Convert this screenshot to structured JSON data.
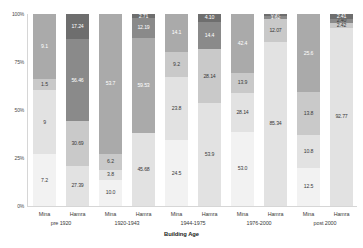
{
  "chart_data": {
    "type": "bar",
    "title": "",
    "xlabel": "Building Age",
    "ylabel": "",
    "ylim": [
      0,
      100
    ],
    "stacked": true,
    "percent": true,
    "grid": false,
    "legend": "none",
    "ytick_labels": [
      "0%",
      "25%",
      "50%",
      "75%",
      "100%"
    ],
    "ytick_values": [
      0,
      25,
      50,
      75,
      100
    ],
    "categories": [
      "pre 1920",
      "1920-1943",
      "1944-1975",
      "1976-2000",
      "post 2000"
    ],
    "subcategories": [
      "Mina",
      "Hamra"
    ],
    "series": [
      {
        "name": "s1",
        "color": "#f2f2f2"
      },
      {
        "name": "s2",
        "color": "#e2e2e2"
      },
      {
        "name": "s3",
        "color": "#c9c9c9"
      },
      {
        "name": "s4",
        "color": "#aaaaaa"
      },
      {
        "name": "s5",
        "color": "#8a8a8a"
      },
      {
        "name": "s6",
        "color": "#6e6e6e"
      }
    ],
    "bars": [
      {
        "group": "pre 1920",
        "sub": "Mina",
        "segments": [
          {
            "label": "7.2",
            "value": 7.2,
            "color": "#f2f2f2",
            "text_color": "#3a3a3a",
            "show": true
          },
          {
            "label": "9",
            "value": 9.0,
            "color": "#e2e2e2",
            "text_color": "#3a3a3a",
            "show": true
          },
          {
            "label": "1.5",
            "value": 1.5,
            "color": "#c9c9c9",
            "text_color": "#3a3a3a",
            "show": true
          },
          {
            "label": "9.1",
            "value": 9.1,
            "color": "#aaaaaa",
            "text_color": "#ffffff",
            "show": true
          }
        ]
      },
      {
        "group": "pre 1920",
        "sub": "Hamra",
        "segments": [
          {
            "label": "27.39",
            "value": 27.39,
            "color": "#e2e2e2",
            "text_color": "#3a3a3a",
            "show": true
          },
          {
            "label": "30.69",
            "value": 30.69,
            "color": "#c9c9c9",
            "text_color": "#3a3a3a",
            "show": true
          },
          {
            "label": "56.46",
            "value": 56.46,
            "color": "#8a8a8a",
            "text_color": "#ffffff",
            "show": true
          },
          {
            "label": "17.24",
            "value": 17.24,
            "color": "#6e6e6e",
            "text_color": "#ffffff",
            "show": true
          }
        ]
      },
      {
        "group": "1920-1943",
        "sub": "Mina",
        "segments": [
          {
            "label": "10.0",
            "value": 10.0,
            "color": "#f2f2f2",
            "text_color": "#3a3a3a",
            "show": true
          },
          {
            "label": "3.8",
            "value": 3.8,
            "color": "#e2e2e2",
            "text_color": "#3a3a3a",
            "show": true
          },
          {
            "label": "6.2",
            "value": 6.2,
            "color": "#c9c9c9",
            "text_color": "#3a3a3a",
            "show": true
          },
          {
            "label": "53.7",
            "value": 53.7,
            "color": "#aaaaaa",
            "text_color": "#ffffff",
            "show": true
          }
        ]
      },
      {
        "group": "1920-1943",
        "sub": "Hamra",
        "segments": [
          {
            "label": "45.68",
            "value": 45.68,
            "color": "#e2e2e2",
            "text_color": "#3a3a3a",
            "show": true
          },
          {
            "label": "59.53",
            "value": 59.53,
            "color": "#aaaaaa",
            "text_color": "#ffffff",
            "show": true
          },
          {
            "label": "12.19",
            "value": 12.19,
            "color": "#8a8a8a",
            "text_color": "#ffffff",
            "show": true
          },
          {
            "label": "2.71",
            "value": 2.71,
            "color": "#6e6e6e",
            "text_color": "#ffffff",
            "show": true
          }
        ]
      },
      {
        "group": "1944-1975",
        "sub": "Mina",
        "segments": [
          {
            "label": "24.5",
            "value": 24.5,
            "color": "#f2f2f2",
            "text_color": "#3a3a3a",
            "show": true
          },
          {
            "label": "23.8",
            "value": 23.8,
            "color": "#e2e2e2",
            "text_color": "#3a3a3a",
            "show": true
          },
          {
            "label": "9.2",
            "value": 9.2,
            "color": "#c9c9c9",
            "text_color": "#3a3a3a",
            "show": true
          },
          {
            "label": "14.1",
            "value": 14.1,
            "color": "#aaaaaa",
            "text_color": "#ffffff",
            "show": true
          }
        ]
      },
      {
        "group": "1944-1975",
        "sub": "Hamra",
        "segments": [
          {
            "label": "53.9",
            "value": 53.9,
            "color": "#e2e2e2",
            "text_color": "#3a3a3a",
            "show": true
          },
          {
            "label": "28.14",
            "value": 28.14,
            "color": "#c9c9c9",
            "text_color": "#3a3a3a",
            "show": true
          },
          {
            "label": "14.4",
            "value": 14.4,
            "color": "#8a8a8a",
            "text_color": "#ffffff",
            "show": true
          },
          {
            "label": "4.10",
            "value": 4.1,
            "color": "#6e6e6e",
            "text_color": "#ffffff",
            "show": true
          }
        ]
      },
      {
        "group": "1976-2000",
        "sub": "Mina",
        "segments": [
          {
            "label": "53.0",
            "value": 53.0,
            "color": "#f2f2f2",
            "text_color": "#3a3a3a",
            "show": true
          },
          {
            "label": "28.14",
            "value": 28.14,
            "color": "#e2e2e2",
            "text_color": "#3a3a3a",
            "show": true
          },
          {
            "label": "13.9",
            "value": 13.9,
            "color": "#c9c9c9",
            "text_color": "#3a3a3a",
            "show": true
          },
          {
            "label": "42.4",
            "value": 42.4,
            "color": "#aaaaaa",
            "text_color": "#ffffff",
            "show": true
          }
        ]
      },
      {
        "group": "1976-2000",
        "sub": "Hamra",
        "segments": [
          {
            "label": "85.34",
            "value": 85.34,
            "color": "#e2e2e2",
            "text_color": "#3a3a3a",
            "show": true
          },
          {
            "label": "12.07",
            "value": 12.07,
            "color": "#c9c9c9",
            "text_color": "#3a3a3a",
            "show": true
          },
          {
            "label": "1.62",
            "value": 1.62,
            "color": "#8a8a8a",
            "text_color": "#ffffff",
            "show": true
          },
          {
            "label": "0.97",
            "value": 0.97,
            "color": "#6e6e6e",
            "text_color": "#ffffff",
            "show": true
          }
        ]
      },
      {
        "group": "post 2000",
        "sub": "Mina",
        "segments": [
          {
            "label": "12.5",
            "value": 12.5,
            "color": "#f2f2f2",
            "text_color": "#3a3a3a",
            "show": true
          },
          {
            "label": "10.8",
            "value": 10.8,
            "color": "#e2e2e2",
            "text_color": "#3a3a3a",
            "show": true
          },
          {
            "label": "13.8",
            "value": 13.8,
            "color": "#c9c9c9",
            "text_color": "#3a3a3a",
            "show": true
          },
          {
            "label": "25.6",
            "value": 25.6,
            "color": "#aaaaaa",
            "text_color": "#ffffff",
            "show": true
          }
        ]
      },
      {
        "group": "post 2000",
        "sub": "Hamra",
        "segments": [
          {
            "label": "92.77",
            "value": 92.77,
            "color": "#e2e2e2",
            "text_color": "#3a3a3a",
            "show": true
          },
          {
            "label": "2.42",
            "value": 2.42,
            "color": "#c9c9c9",
            "text_color": "#3a3a3a",
            "show": true
          },
          {
            "label": "2.40",
            "value": 2.4,
            "color": "#8a8a8a",
            "text_color": "#3a3a3a",
            "show": true
          },
          {
            "label": "2.41",
            "value": 2.41,
            "color": "#6e6e6e",
            "text_color": "#ffffff",
            "show": true
          }
        ]
      }
    ]
  }
}
